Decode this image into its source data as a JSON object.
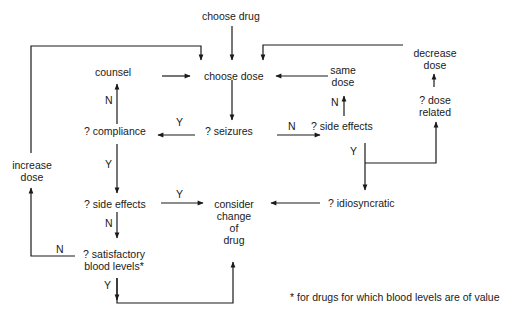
{
  "diagram": {
    "nodes": {
      "choose_drug": "choose drug",
      "choose_dose": "choose dose",
      "counsel": "counsel",
      "compliance": "? compliance",
      "seizures": "? seizures",
      "same_dose_1": "same",
      "same_dose_2": "dose",
      "side_effects_right": "? side effects",
      "decrease_dose_1": "decrease",
      "decrease_dose_2": "dose",
      "dose_related_1": "? dose",
      "dose_related_2": "related",
      "increase_dose_1": "increase",
      "increase_dose_2": "dose",
      "side_effects_left": "? side effects",
      "consider_1": "consider",
      "consider_2": "change",
      "consider_3": "of",
      "consider_4": "drug",
      "idiosyncratic": "? idiosyncratic",
      "satisfactory_1": "? satisfactory",
      "satisfactory_2": "blood levels*"
    },
    "edge_labels": {
      "compliance_to_counsel": "N",
      "seizures_to_compliance": "Y",
      "seizures_to_side_effects": "N",
      "side_effects_to_same_dose": "N",
      "side_effects_right_yes": "Y",
      "compliance_yes": "Y",
      "side_effects_left_to_consider": "Y",
      "side_effects_left_no": "N",
      "satisfactory_no": "N",
      "satisfactory_yes": "Y"
    },
    "footnote": "* for drugs for which blood levels are of value"
  }
}
